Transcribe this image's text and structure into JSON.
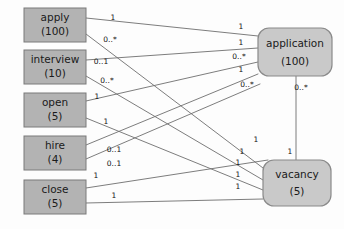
{
  "diagram": {
    "type": "uml-class-association-diagram",
    "background_color": "#fdfdfd",
    "left_node_fill": "#b3b3b3",
    "right_node_fill": "#c9c9c9",
    "edge_color": "#6e6e6e",
    "left_nodes": [
      {
        "id": "apply",
        "label": "apply",
        "count": "(100)",
        "x": 24,
        "y": 8,
        "w": 62,
        "h": 34
      },
      {
        "id": "interview",
        "label": "interview",
        "count": "(10)",
        "x": 24,
        "y": 50,
        "w": 62,
        "h": 34
      },
      {
        "id": "open",
        "label": "open",
        "count": "(5)",
        "x": 24,
        "y": 93,
        "w": 62,
        "h": 34
      },
      {
        "id": "hire",
        "label": "hire",
        "count": "(4)",
        "x": 24,
        "y": 136,
        "w": 62,
        "h": 34
      },
      {
        "id": "close",
        "label": "close",
        "count": "(5)",
        "x": 24,
        "y": 180,
        "w": 62,
        "h": 34
      }
    ],
    "right_nodes": [
      {
        "id": "application",
        "label": "application",
        "count": "(100)",
        "x": 258,
        "y": 28,
        "w": 74,
        "h": 48,
        "r": 11
      },
      {
        "id": "vacancy",
        "label": "vacancy",
        "count": "(5)",
        "x": 263,
        "y": 160,
        "w": 68,
        "h": 46,
        "r": 11
      }
    ],
    "edges": [
      {
        "from": "apply",
        "to": "application",
        "x1": 86,
        "y1": 18,
        "x2": 258,
        "y2": 36,
        "src_mult": "1",
        "dst_mult": "1"
      },
      {
        "from": "apply",
        "to": "vacancy",
        "x1": 86,
        "y1": 34,
        "x2": 263,
        "y2": 168,
        "src_mult": "0..*",
        "dst_mult": "1"
      },
      {
        "from": "interview",
        "to": "application",
        "x1": 86,
        "y1": 60,
        "x2": 258,
        "y2": 48,
        "src_mult": "0..1",
        "dst_mult": "1"
      },
      {
        "from": "interview",
        "to": "vacancy",
        "x1": 86,
        "y1": 76,
        "x2": 263,
        "y2": 180,
        "src_mult": "0..*",
        "dst_mult": "1"
      },
      {
        "from": "open",
        "to": "application",
        "x1": 86,
        "y1": 101,
        "x2": 258,
        "y2": 62,
        "src_mult": "1",
        "dst_mult": "0..*"
      },
      {
        "from": "open",
        "to": "vacancy",
        "x1": 86,
        "y1": 118,
        "x2": 263,
        "y2": 190,
        "src_mult": "1",
        "dst_mult": "1"
      },
      {
        "from": "hire",
        "to": "application",
        "x1": 86,
        "y1": 145,
        "x2": 258,
        "y2": 74,
        "src_mult": "0..1",
        "dst_mult": "1"
      },
      {
        "from": "hire",
        "to": "application",
        "x1": 86,
        "y1": 159,
        "x2": 260,
        "y2": 84,
        "src_mult": "0..1",
        "dst_mult": "0..*"
      },
      {
        "from": "close",
        "to": "vacancy",
        "x1": 86,
        "y1": 188,
        "x2": 268,
        "y2": 160,
        "src_mult": "1",
        "dst_mult": "1"
      },
      {
        "from": "close",
        "to": "vacancy",
        "x1": 86,
        "y1": 203,
        "x2": 263,
        "y2": 199,
        "src_mult": "1",
        "dst_mult": "1"
      },
      {
        "from": "application",
        "to": "vacancy",
        "x1": 296,
        "y1": 76,
        "x2": 296,
        "y2": 160,
        "src_mult": "0..*",
        "dst_mult": "1"
      }
    ],
    "multiplicity_labels": [
      {
        "text": "1",
        "x": 113,
        "y": 18
      },
      {
        "text": "0..*",
        "x": 110,
        "y": 40
      },
      {
        "text": "0..1",
        "x": 101,
        "y": 62
      },
      {
        "text": "0..*",
        "x": 107,
        "y": 81
      },
      {
        "text": "1",
        "x": 97,
        "y": 97
      },
      {
        "text": "1",
        "x": 106,
        "y": 122
      },
      {
        "text": "0..1",
        "x": 114,
        "y": 150
      },
      {
        "text": "0..1",
        "x": 114,
        "y": 164
      },
      {
        "text": "1",
        "x": 96,
        "y": 176
      },
      {
        "text": "1",
        "x": 114,
        "y": 196
      },
      {
        "text": "1",
        "x": 241,
        "y": 27
      },
      {
        "text": "1",
        "x": 241,
        "y": 43
      },
      {
        "text": "0..*",
        "x": 239,
        "y": 57
      },
      {
        "text": "1",
        "x": 241,
        "y": 70
      },
      {
        "text": "0..*",
        "x": 247,
        "y": 85
      },
      {
        "text": "0..*",
        "x": 301,
        "y": 88
      },
      {
        "text": "1",
        "x": 256,
        "y": 140
      },
      {
        "text": "1",
        "x": 242,
        "y": 152
      },
      {
        "text": "1",
        "x": 238,
        "y": 163
      },
      {
        "text": "1",
        "x": 238,
        "y": 175
      },
      {
        "text": "1",
        "x": 238,
        "y": 187
      },
      {
        "text": "1",
        "x": 290,
        "y": 152
      }
    ]
  }
}
